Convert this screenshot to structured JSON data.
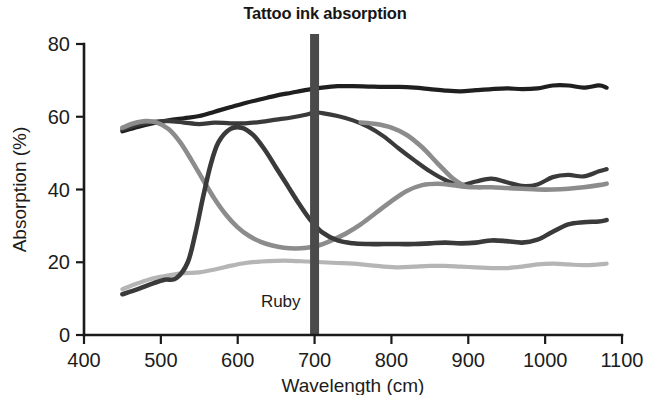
{
  "chart_data": {
    "type": "line",
    "title": "Tattoo ink absorption",
    "xlabel": "Wavelength (cm)",
    "ylabel": "Absorption (%)",
    "xlim": [
      400,
      1100
    ],
    "ylim": [
      0,
      80
    ],
    "xticks": [
      400,
      500,
      600,
      700,
      800,
      900,
      1000,
      1100
    ],
    "yticks": [
      0,
      20,
      40,
      60,
      80
    ],
    "grid": false,
    "legend": "none",
    "annotations": [
      {
        "name": "ruby-marker",
        "label": "Ruby",
        "x": 700,
        "orientation": "vertical",
        "color": "#4a4a4a"
      }
    ],
    "series": [
      {
        "name": "series-black",
        "color": "#1f1f1f",
        "width": 4.2,
        "x": [
          450,
          470,
          490,
          510,
          530,
          550,
          570,
          590,
          610,
          630,
          650,
          670,
          690,
          710,
          730,
          750,
          770,
          790,
          810,
          830,
          850,
          870,
          890,
          910,
          930,
          950,
          970,
          990,
          1010,
          1030,
          1050,
          1070,
          1080
        ],
        "y": [
          56.0,
          57.2,
          58.2,
          59.0,
          59.6,
          60.2,
          61.4,
          62.6,
          63.8,
          64.8,
          65.8,
          66.6,
          67.4,
          68.0,
          68.4,
          68.4,
          68.3,
          68.2,
          68.2,
          68.0,
          67.6,
          67.2,
          67.0,
          67.3,
          67.6,
          67.8,
          67.6,
          67.8,
          68.6,
          68.6,
          68.0,
          68.6,
          68.0
        ]
      },
      {
        "name": "series-dark-gray",
        "color": "#3a3a3a",
        "width": 4.2,
        "x": [
          450,
          470,
          490,
          510,
          530,
          550,
          570,
          590,
          610,
          630,
          650,
          670,
          690,
          700,
          710,
          730,
          750,
          770,
          790,
          810,
          830,
          850,
          870,
          890,
          910,
          930,
          950,
          970,
          990,
          1010,
          1030,
          1050,
          1070,
          1080
        ],
        "y": [
          56.5,
          57.8,
          58.6,
          58.8,
          58.4,
          58.0,
          58.4,
          58.2,
          58.2,
          58.6,
          59.2,
          59.8,
          60.6,
          61.2,
          61.0,
          60.2,
          59.0,
          57.2,
          54.6,
          51.2,
          48.0,
          45.0,
          42.6,
          41.2,
          42.2,
          43.0,
          42.0,
          41.0,
          41.4,
          43.4,
          44.0,
          43.6,
          45.0,
          45.6
        ]
      },
      {
        "name": "series-mid-gray",
        "color": "#8c8c8c",
        "width": 4.6,
        "x": [
          450,
          465,
          480,
          495,
          510,
          525,
          540,
          555,
          570,
          585,
          600,
          615,
          630,
          645,
          660,
          675,
          690,
          705,
          720,
          740,
          760,
          780,
          800,
          820,
          840,
          860,
          880,
          895,
          910,
          930,
          950,
          970,
          990,
          1010,
          1030,
          1050,
          1070,
          1080
        ],
        "y": [
          57.0,
          58.2,
          58.8,
          58.4,
          56.6,
          53.0,
          48.0,
          42.6,
          37.4,
          33.0,
          29.6,
          27.2,
          25.6,
          24.6,
          24.0,
          23.8,
          24.0,
          24.6,
          25.8,
          27.8,
          30.4,
          33.6,
          36.8,
          39.6,
          41.2,
          41.6,
          41.2,
          40.8,
          40.6,
          40.6,
          40.4,
          40.2,
          40.0,
          40.0,
          40.2,
          40.6,
          41.2,
          41.6
        ]
      },
      {
        "name": "series-descending-gray",
        "color": "#8c8c8c",
        "width": 4.6,
        "x": [
          760,
          780,
          800,
          820,
          840,
          860,
          880,
          895
        ],
        "y": [
          58.4,
          58.0,
          57.0,
          55.0,
          51.6,
          47.2,
          43.0,
          41.0
        ]
      },
      {
        "name": "series-light-gray",
        "color": "#b5b5b5",
        "width": 4.2,
        "x": [
          450,
          470,
          490,
          510,
          530,
          550,
          570,
          590,
          610,
          630,
          650,
          670,
          690,
          710,
          730,
          750,
          770,
          790,
          810,
          830,
          850,
          870,
          890,
          910,
          930,
          950,
          970,
          990,
          1010,
          1030,
          1050,
          1070,
          1080
        ],
        "y": [
          12.6,
          14.2,
          15.6,
          16.4,
          17.0,
          17.2,
          18.0,
          19.0,
          19.8,
          20.2,
          20.4,
          20.4,
          20.2,
          20.0,
          19.8,
          19.6,
          19.2,
          18.8,
          18.6,
          18.8,
          19.0,
          19.0,
          18.8,
          18.6,
          18.4,
          18.4,
          18.8,
          19.4,
          19.6,
          19.4,
          19.2,
          19.4,
          19.6
        ]
      },
      {
        "name": "series-rising-dark",
        "color": "#3a3a3a",
        "width": 4.6,
        "x": [
          450,
          470,
          490,
          505,
          520,
          535,
          545,
          555,
          565,
          575,
          590,
          605,
          620,
          635,
          650,
          665,
          680,
          695,
          710,
          730,
          750,
          770,
          790,
          810,
          830,
          850,
          870,
          890,
          910,
          930,
          950,
          970,
          990,
          1010,
          1030,
          1050,
          1070,
          1080
        ],
        "y": [
          11.2,
          12.6,
          14.2,
          15.2,
          15.6,
          20.0,
          28.0,
          38.0,
          47.0,
          53.0,
          56.6,
          57.0,
          55.0,
          51.0,
          46.0,
          41.0,
          36.0,
          31.5,
          28.2,
          26.0,
          25.2,
          25.0,
          25.0,
          25.0,
          25.0,
          25.2,
          25.4,
          25.2,
          25.4,
          26.0,
          25.8,
          25.4,
          26.2,
          28.4,
          30.4,
          31.0,
          31.2,
          31.6
        ]
      }
    ]
  },
  "axes": {
    "y_tick_labels": [
      "80",
      "60",
      "40",
      "20",
      "0"
    ],
    "x_tick_labels": [
      "400",
      "500",
      "600",
      "700",
      "800",
      "900",
      "1000",
      "1100"
    ],
    "y_axis_title": "Absorption (%)",
    "x_axis_title": "Wavelength (cm)"
  },
  "marker": {
    "label": "Ruby"
  },
  "colors": {
    "background": "#ffffff",
    "axis": "#1a1a1a",
    "marker_bar": "#4a4a4a",
    "series_black": "#1f1f1f",
    "series_dark_gray": "#3a3a3a",
    "series_mid_gray": "#8c8c8c",
    "series_light_gray": "#b5b5b5"
  }
}
